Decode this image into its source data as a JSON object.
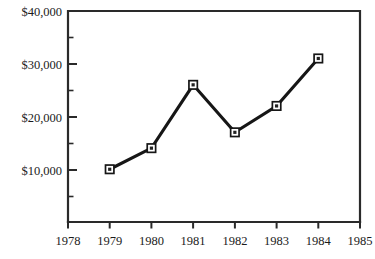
{
  "chart_data": {
    "type": "line",
    "title": "",
    "subtitle": "",
    "xlabel": "",
    "ylabel": "",
    "x": [
      1979,
      1980,
      1981,
      1982,
      1983,
      1984
    ],
    "values": [
      10000,
      14000,
      26000,
      17000,
      22000,
      31000
    ],
    "series": [
      {
        "name": "",
        "values": [
          10000,
          14000,
          26000,
          17000,
          22000,
          31000
        ]
      }
    ],
    "xlim": [
      1978,
      1985
    ],
    "ylim": [
      0,
      40000
    ],
    "x_tick_labels": [
      "1978",
      "1979",
      "1980",
      "1981",
      "1982",
      "1983",
      "1984",
      "1985"
    ],
    "x_tick_values": [
      1978,
      1979,
      1980,
      1981,
      1982,
      1983,
      1984,
      1985
    ],
    "y_tick_labels": [
      "$40,000",
      "$30,000",
      "$20,000",
      "$10,000"
    ],
    "y_tick_values": [
      40000,
      30000,
      20000,
      10000
    ],
    "y_minor_tick_values": [
      35000,
      25000,
      15000,
      5000
    ],
    "grid": false,
    "legend": "none",
    "marker": "square",
    "line_color": "#161616",
    "marker_fill": "#ffffff",
    "marker_edge_color": "#161616",
    "axis_color": "#2a2a2a",
    "background_color": "#ffffff",
    "points": [
      {
        "x": 1979,
        "y": 10000,
        "label": "$10,000"
      },
      {
        "x": 1980,
        "y": 14000,
        "label": "$14,000"
      },
      {
        "x": 1981,
        "y": 26000,
        "label": "$26,000"
      },
      {
        "x": 1982,
        "y": 17000,
        "label": "$17,000"
      },
      {
        "x": 1983,
        "y": 22000,
        "label": "$22,000"
      },
      {
        "x": 1984,
        "y": 31000,
        "label": "$31,000"
      }
    ]
  },
  "axes": {
    "y_ticks": [
      {
        "label": "$40,000",
        "y": 11
      },
      {
        "label": "$30,000",
        "y": 64
      },
      {
        "label": "$20,000",
        "y": 117
      },
      {
        "label": "$10,000",
        "y": 170
      }
    ],
    "y_minor_ticks": [
      {
        "y": 37.5
      },
      {
        "y": 90.5
      },
      {
        "y": 143.5
      },
      {
        "y": 196.5
      }
    ],
    "x_ticks": [
      {
        "label": "1978",
        "x": 68
      },
      {
        "label": "1979",
        "x": 109.7
      },
      {
        "label": "1980",
        "x": 151.4
      },
      {
        "label": "1981",
        "x": 193.1
      },
      {
        "label": "1982",
        "x": 234.9
      },
      {
        "label": "1983",
        "x": 276.6
      },
      {
        "label": "1984",
        "x": 318.3
      },
      {
        "label": "1985",
        "x": 360
      }
    ]
  },
  "plot_geometry": {
    "left": 68,
    "right": 360,
    "top": 11,
    "bottom": 222
  },
  "caption": ""
}
